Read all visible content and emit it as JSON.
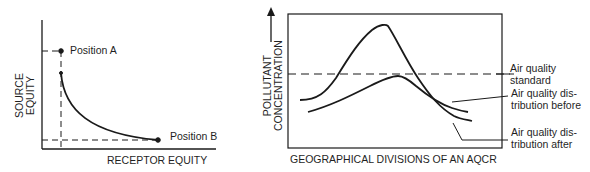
{
  "left_chart": {
    "y_axis_label_line1": "SOURCE",
    "y_axis_label_line2": "EQUITY",
    "x_axis_label": "RECEPTOR EQUITY",
    "point_a_label": "Position A",
    "point_b_label": "Position B"
  },
  "right_chart": {
    "y_axis_label_line1": "POLLUTANT",
    "y_axis_label_line2": "CONCENTRATION",
    "x_axis_label": "GEOGRAPHICAL DIVISIONS OF AN AQCR",
    "standard_label_line1": "Air quality",
    "standard_label_line2": "standard",
    "before_label_line1": "Air quality dis-",
    "before_label_line2": "tribution before",
    "after_label_line1": "Air quality dis-",
    "after_label_line2": "tribution after"
  },
  "colors": {
    "ink": "#1a1a1a",
    "background": "#ffffff"
  }
}
